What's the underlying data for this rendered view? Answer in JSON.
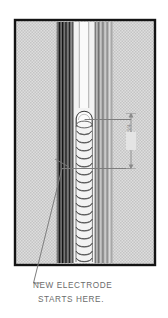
{
  "figure": {
    "type": "welding-cross-section-illustration",
    "background_color": "#ffffff",
    "frame": {
      "border_color": "#1a1a1a",
      "fill_color": "#d9d9d9",
      "x": 15,
      "y": 20,
      "width": 140,
      "height": 245
    },
    "base_metal": {
      "name": "base-metal-plate",
      "fill_color": "#d4d4d4",
      "texture": "stipple"
    },
    "groove": {
      "name": "weld-groove",
      "left_wall_color": "#232323",
      "right_wall_color": "#9a9a9a",
      "center_color": "#f2f2f2"
    },
    "weld_bead": {
      "name": "weld-bead-ripples",
      "ripple_count": 16,
      "outline_color": "#4a4a4a",
      "fill_color": "#f4f4f4"
    },
    "crater": {
      "name": "restart-crater",
      "outline_color": "#3a3a3a",
      "fill_color": "#fbfbfb",
      "center_x": 84,
      "center_y": 118
    },
    "leaders": {
      "color": "#7d7d7d",
      "crater_leader_label": "crater-leader-line",
      "restart_leader_label": "restart-leader-line"
    }
  },
  "annotations": {
    "dimension": {
      "name": "bead-width-dimension",
      "value": "3/4",
      "orientation": "vertical",
      "arrow_color": "#8a8a8a"
    },
    "caption": {
      "name": "new-electrode-caption",
      "line_1": "NEW ELECTRODE",
      "line_2": "STARTS HERE.",
      "color": "#6b6b6b"
    }
  }
}
